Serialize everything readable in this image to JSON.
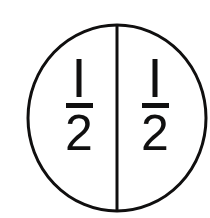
{
  "figure": {
    "shape": "circle",
    "background_color": "#ffffff",
    "stroke_color": "#100f0f",
    "circle": {
      "center_x": 117,
      "center_y": 118,
      "radius_x": 90,
      "radius_y": 93,
      "stroke_width": 3
    },
    "divider": {
      "orientation": "vertical",
      "x": 117,
      "y_start": 25,
      "y_end": 211,
      "stroke_width": 3
    },
    "parts": [
      {
        "id": "left-half",
        "position": "left",
        "numerator": "1",
        "denominator": "2",
        "value": "1/2"
      },
      {
        "id": "right-half",
        "position": "right",
        "numerator": "1",
        "denominator": "2",
        "value": "1/2"
      }
    ]
  }
}
